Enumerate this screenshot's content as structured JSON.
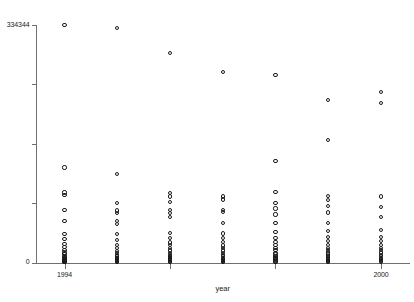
{
  "chart_data": {
    "type": "scatter",
    "title": "",
    "xlabel": "year",
    "ylabel": "",
    "xlim": [
      1993.45,
      2000.55
    ],
    "ylim": [
      0,
      334344
    ],
    "grid": false,
    "legend": null,
    "marker": "open-circle",
    "x_ticks": [
      1994,
      1996,
      1998,
      2000
    ],
    "x_tick_labels": [
      "1994",
      "",
      "",
      "2000"
    ],
    "y_ticks": [
      0,
      83586,
      167172,
      250758,
      334344
    ],
    "y_tick_labels": [
      "0",
      "",
      "",
      "",
      "334344"
    ],
    "series": [
      {
        "name": "observations",
        "points": [
          {
            "x": 1994,
            "y": 334344
          },
          {
            "x": 1994,
            "y": 133738
          },
          {
            "x": 1994,
            "y": 98434
          },
          {
            "x": 1994,
            "y": 94672
          },
          {
            "x": 1994,
            "y": 74128
          },
          {
            "x": 1994,
            "y": 58086
          },
          {
            "x": 1994,
            "y": 40238
          },
          {
            "x": 1994,
            "y": 33022
          },
          {
            "x": 1994,
            "y": 26407
          },
          {
            "x": 1994,
            "y": 21743
          },
          {
            "x": 1994,
            "y": 17680
          },
          {
            "x": 1994,
            "y": 14068
          },
          {
            "x": 1994,
            "y": 11660
          },
          {
            "x": 1994,
            "y": 9553
          },
          {
            "x": 1994,
            "y": 7747
          },
          {
            "x": 1994,
            "y": 6242
          },
          {
            "x": 1994,
            "y": 5038
          },
          {
            "x": 1994,
            "y": 4135
          },
          {
            "x": 1994,
            "y": 3232
          },
          {
            "x": 1994,
            "y": 2409
          },
          {
            "x": 1994,
            "y": 1806
          },
          {
            "x": 1994,
            "y": 1204
          },
          {
            "x": 1994,
            "y": 602
          },
          {
            "x": 1995,
            "y": 330582
          },
          {
            "x": 1995,
            "y": 124264
          },
          {
            "x": 1995,
            "y": 84051
          },
          {
            "x": 1995,
            "y": 73225
          },
          {
            "x": 1995,
            "y": 69162
          },
          {
            "x": 1995,
            "y": 58086
          },
          {
            "x": 1995,
            "y": 54625
          },
          {
            "x": 1995,
            "y": 40238
          },
          {
            "x": 1995,
            "y": 31818
          },
          {
            "x": 1995,
            "y": 25204
          },
          {
            "x": 1995,
            "y": 20539
          },
          {
            "x": 1995,
            "y": 16476
          },
          {
            "x": 1995,
            "y": 13466
          },
          {
            "x": 1995,
            "y": 10455
          },
          {
            "x": 1995,
            "y": 8348
          },
          {
            "x": 1995,
            "y": 6843
          },
          {
            "x": 1995,
            "y": 5339
          },
          {
            "x": 1995,
            "y": 4135
          },
          {
            "x": 1995,
            "y": 3232
          },
          {
            "x": 1995,
            "y": 2409
          },
          {
            "x": 1995,
            "y": 1505
          },
          {
            "x": 1995,
            "y": 903
          },
          {
            "x": 1995,
            "y": 301
          },
          {
            "x": 1996,
            "y": 294676
          },
          {
            "x": 1996,
            "y": 97531
          },
          {
            "x": 1996,
            "y": 92866
          },
          {
            "x": 1996,
            "y": 85555
          },
          {
            "x": 1996,
            "y": 74128
          },
          {
            "x": 1996,
            "y": 69162
          },
          {
            "x": 1996,
            "y": 63894
          },
          {
            "x": 1996,
            "y": 41141
          },
          {
            "x": 1996,
            "y": 33925
          },
          {
            "x": 1996,
            "y": 28213
          },
          {
            "x": 1996,
            "y": 24301
          },
          {
            "x": 1996,
            "y": 20238
          },
          {
            "x": 1996,
            "y": 16777
          },
          {
            "x": 1996,
            "y": 13767
          },
          {
            "x": 1996,
            "y": 11058
          },
          {
            "x": 1996,
            "y": 9252
          },
          {
            "x": 1996,
            "y": 7446
          },
          {
            "x": 1996,
            "y": 5640
          },
          {
            "x": 1996,
            "y": 4435
          },
          {
            "x": 1996,
            "y": 3232
          },
          {
            "x": 1996,
            "y": 2108
          },
          {
            "x": 1996,
            "y": 1204
          },
          {
            "x": 1996,
            "y": 602
          },
          {
            "x": 1997,
            "y": 268570
          },
          {
            "x": 1997,
            "y": 92866
          },
          {
            "x": 1997,
            "y": 88803
          },
          {
            "x": 1997,
            "y": 73827
          },
          {
            "x": 1997,
            "y": 70968
          },
          {
            "x": 1997,
            "y": 55227
          },
          {
            "x": 1997,
            "y": 40840
          },
          {
            "x": 1997,
            "y": 34829
          },
          {
            "x": 1997,
            "y": 29116
          },
          {
            "x": 1997,
            "y": 24000
          },
          {
            "x": 1997,
            "y": 20238
          },
          {
            "x": 1997,
            "y": 16777
          },
          {
            "x": 1997,
            "y": 13466
          },
          {
            "x": 1997,
            "y": 11058
          },
          {
            "x": 1997,
            "y": 8649
          },
          {
            "x": 1997,
            "y": 6843
          },
          {
            "x": 1997,
            "y": 5339
          },
          {
            "x": 1997,
            "y": 4135
          },
          {
            "x": 1997,
            "y": 3232
          },
          {
            "x": 1997,
            "y": 2108
          },
          {
            "x": 1997,
            "y": 1204
          },
          {
            "x": 1997,
            "y": 602
          },
          {
            "x": 1998,
            "y": 264507
          },
          {
            "x": 1998,
            "y": 142464
          },
          {
            "x": 1998,
            "y": 99036
          },
          {
            "x": 1998,
            "y": 84051
          },
          {
            "x": 1998,
            "y": 75934
          },
          {
            "x": 1998,
            "y": 67657
          },
          {
            "x": 1998,
            "y": 55227
          },
          {
            "x": 1998,
            "y": 42947
          },
          {
            "x": 1998,
            "y": 34829
          },
          {
            "x": 1998,
            "y": 28514
          },
          {
            "x": 1998,
            "y": 24301
          },
          {
            "x": 1998,
            "y": 20539
          },
          {
            "x": 1998,
            "y": 17078
          },
          {
            "x": 1998,
            "y": 13767
          },
          {
            "x": 1998,
            "y": 11359
          },
          {
            "x": 1998,
            "y": 9252
          },
          {
            "x": 1998,
            "y": 7145
          },
          {
            "x": 1998,
            "y": 5640
          },
          {
            "x": 1998,
            "y": 4135
          },
          {
            "x": 1998,
            "y": 2710
          },
          {
            "x": 1998,
            "y": 1505
          },
          {
            "x": 1998,
            "y": 602
          },
          {
            "x": 1999,
            "y": 228601
          },
          {
            "x": 1999,
            "y": 172800
          },
          {
            "x": 1999,
            "y": 93167
          },
          {
            "x": 1999,
            "y": 88201
          },
          {
            "x": 1999,
            "y": 79093
          },
          {
            "x": 1999,
            "y": 70366
          },
          {
            "x": 1999,
            "y": 55227
          },
          {
            "x": 1999,
            "y": 44151
          },
          {
            "x": 1999,
            "y": 36033
          },
          {
            "x": 1999,
            "y": 29718
          },
          {
            "x": 1999,
            "y": 24903
          },
          {
            "x": 1999,
            "y": 20840
          },
          {
            "x": 1999,
            "y": 17379
          },
          {
            "x": 1999,
            "y": 14068
          },
          {
            "x": 1999,
            "y": 11359
          },
          {
            "x": 1999,
            "y": 9252
          },
          {
            "x": 1999,
            "y": 7145
          },
          {
            "x": 1999,
            "y": 5339
          },
          {
            "x": 1999,
            "y": 3834
          },
          {
            "x": 1999,
            "y": 2409
          },
          {
            "x": 1999,
            "y": 1204
          },
          {
            "x": 1999,
            "y": 602
          },
          {
            "x": 2000,
            "y": 239677
          },
          {
            "x": 2000,
            "y": 224538
          },
          {
            "x": 2000,
            "y": 92866
          },
          {
            "x": 2000,
            "y": 78190
          },
          {
            "x": 2000,
            "y": 63894
          },
          {
            "x": 2000,
            "y": 45656
          },
          {
            "x": 2000,
            "y": 36033
          },
          {
            "x": 2000,
            "y": 30020
          },
          {
            "x": 2000,
            "y": 25204
          },
          {
            "x": 2000,
            "y": 20840
          },
          {
            "x": 2000,
            "y": 17379
          },
          {
            "x": 2000,
            "y": 14068
          },
          {
            "x": 2000,
            "y": 11058
          },
          {
            "x": 2000,
            "y": 8649
          },
          {
            "x": 2000,
            "y": 6542
          },
          {
            "x": 2000,
            "y": 4736
          },
          {
            "x": 2000,
            "y": 3232
          },
          {
            "x": 2000,
            "y": 1806
          },
          {
            "x": 2000,
            "y": 602
          }
        ]
      }
    ]
  }
}
